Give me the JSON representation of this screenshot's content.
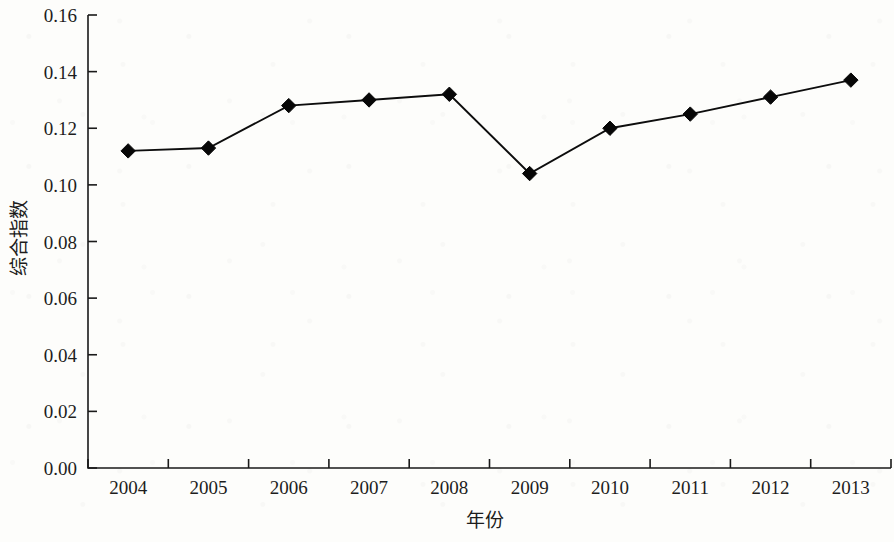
{
  "chart_data": {
    "type": "line",
    "title": "",
    "xlabel": "年份",
    "ylabel": "综合指数",
    "categories": [
      "2004",
      "2005",
      "2006",
      "2007",
      "2008",
      "2009",
      "2010",
      "2011",
      "2012",
      "2013"
    ],
    "series": [
      {
        "name": "综合指数",
        "values": [
          0.112,
          0.113,
          0.128,
          0.13,
          0.132,
          0.104,
          0.12,
          0.125,
          0.131,
          0.137
        ],
        "marker": "diamond",
        "color": "#070707"
      }
    ],
    "ylim": [
      0.0,
      0.16
    ],
    "ytick_step": 0.02,
    "ytick_labels": [
      "0.00",
      "0.02",
      "0.04",
      "0.06",
      "0.08",
      "0.10",
      "0.12",
      "0.14",
      "0.16"
    ],
    "ytick_values": [
      0.0,
      0.02,
      0.04,
      0.06,
      0.08,
      0.1,
      0.12,
      0.14,
      0.16
    ],
    "grid": false,
    "legend": "none",
    "axis_color": "#1a1a1a",
    "background": "#fdfdfb"
  },
  "figure": {
    "x_axis_label": "年份",
    "y_axis_label": "综合指数"
  }
}
